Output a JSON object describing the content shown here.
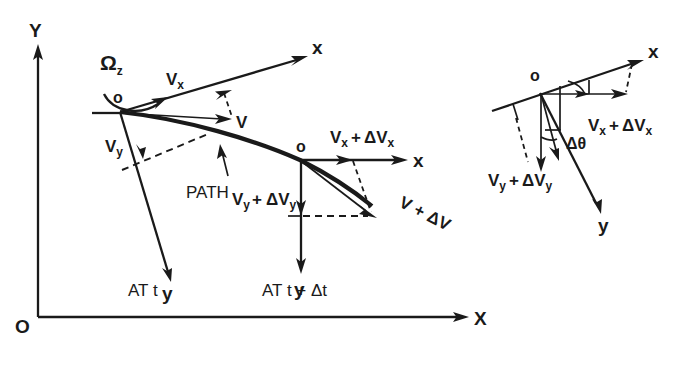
{
  "figure": {
    "title": "Velocity components in a rotating body-fixed frame at times t and t + Δt",
    "background_color": "#ffffff",
    "ink_color": "#1a1a1a",
    "width": 693,
    "height": 368
  },
  "global_axes": {
    "y_label": "Y",
    "x_label": "X",
    "origin_label": "O"
  },
  "frame_at_t": {
    "caption": "AT t",
    "origin_label": "o",
    "x_axis_label": "x",
    "y_axis_label": "y",
    "rotation_label": "Ω",
    "rotation_subscript": "z",
    "vx_label": "V",
    "vx_subscript": "x",
    "vy_label": "V",
    "vy_subscript": "y",
    "v_label": "V",
    "path_label": "PATH"
  },
  "frame_at_t_plus_dt": {
    "caption": "AT t + Δt",
    "origin_label": "o",
    "x_axis_label": "x",
    "y_axis_label": "y",
    "vx_plus_dvx": {
      "base": "V",
      "base_sub": "x",
      "operator": "+",
      "delta": "ΔV",
      "delta_sub": "x"
    },
    "vy_plus_dvy": {
      "base": "V",
      "base_sub": "y",
      "operator": "+",
      "delta": "ΔV",
      "delta_sub": "y"
    },
    "v_plus_dv": {
      "base": "V",
      "operator": "+",
      "delta": "ΔV"
    }
  },
  "inset": {
    "origin_label": "o",
    "x_axis_label": "x",
    "y_axis_label": "y",
    "angle_label": "Δθ",
    "vx_plus_dvx": {
      "base": "V",
      "base_sub": "x",
      "operator": "+",
      "delta": "ΔV",
      "delta_sub": "x"
    },
    "vy_plus_dvy": {
      "base": "V",
      "base_sub": "y",
      "operator": "+",
      "delta": "ΔV",
      "delta_sub": "y"
    }
  }
}
